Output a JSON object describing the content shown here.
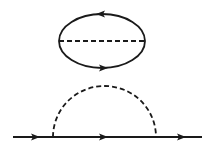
{
  "diagrams": [
    {
      "name": "vacuum-bubble",
      "description": "Closed fermion loop with internal dashed (boson/interaction) line",
      "loop": {
        "cx": 102,
        "cy": 41,
        "rx": 43,
        "ry": 27,
        "arrows": [
          "top-leftward",
          "bottom-rightward"
        ]
      },
      "internal_line": {
        "style": "dashed",
        "x1": 59,
        "x2": 145,
        "y": 41
      }
    },
    {
      "name": "self-energy",
      "description": "Fermion propagator with dashed rainbow loop",
      "propagator": {
        "x1": 13,
        "x2": 202,
        "y": 137,
        "arrows_x": [
          36,
          103,
          182
        ]
      },
      "dashed_arc": {
        "x1": 53,
        "x2": 156,
        "top_y": 86
      }
    }
  ],
  "colors": {
    "stroke": "#1a1a1a",
    "background": "#ffffff"
  }
}
